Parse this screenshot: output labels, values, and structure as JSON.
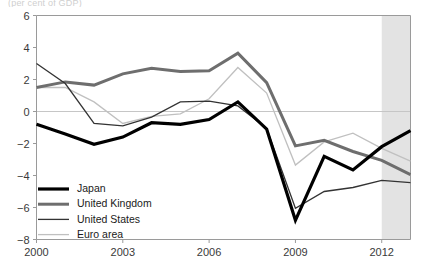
{
  "chart_data": {
    "type": "line",
    "title": "(per cent of GDP)",
    "xlabel": "",
    "ylabel": "",
    "x": [
      2000,
      2001,
      2002,
      2003,
      2004,
      2005,
      2006,
      2007,
      2008,
      2009,
      2010,
      2011,
      2012,
      2013
    ],
    "xlim": [
      2000,
      2013
    ],
    "ylim": [
      -8,
      6
    ],
    "ytick_labels": [
      "6",
      "4",
      "2",
      "0",
      "−2",
      "−4",
      "−6",
      "−8"
    ],
    "yticks": [
      6,
      4,
      2,
      0,
      -2,
      -4,
      -6,
      -8
    ],
    "xtick_labels": [
      "2000",
      "2003",
      "2006",
      "2009",
      "2012"
    ],
    "xticks": [
      2000,
      2003,
      2006,
      2009,
      2012
    ],
    "grid": false,
    "zero_line": true,
    "legend_position": "lower-left",
    "shaded_region": {
      "label": "forecast",
      "from": 2012,
      "to": 2013,
      "color": "#e3e3e3"
    },
    "series": [
      {
        "name": "Japan",
        "color": "#000000",
        "width": 3.2,
        "values": [
          -0.8,
          -1.4,
          -2.05,
          -1.6,
          -0.7,
          -0.8,
          -0.5,
          0.6,
          -1.1,
          -6.8,
          -2.8,
          -3.65,
          -2.2,
          -1.2
        ]
      },
      {
        "name": "United Kingdom",
        "color": "#6e6e6e",
        "width": 3.0,
        "values": [
          1.5,
          1.85,
          1.65,
          2.35,
          2.7,
          2.5,
          2.55,
          3.65,
          1.8,
          -2.15,
          -1.8,
          -2.5,
          -3.05,
          -3.95
        ]
      },
      {
        "name": "United States",
        "color": "#333333",
        "width": 1.3,
        "values": [
          3.0,
          1.75,
          -0.75,
          -0.9,
          -0.35,
          0.6,
          0.65,
          0.35,
          -1.05,
          -6.05,
          -5.0,
          -4.75,
          -4.3,
          -4.45
        ]
      },
      {
        "name": "Euro area",
        "color": "#c0c0c0",
        "width": 1.3,
        "values": [
          1.5,
          1.5,
          0.6,
          -0.75,
          -0.3,
          -0.15,
          0.8,
          2.75,
          1.15,
          -3.35,
          -1.9,
          -1.35,
          -2.3,
          -3.1
        ]
      }
    ]
  },
  "legend": {
    "items": [
      {
        "label": "Japan"
      },
      {
        "label": "United Kingdom"
      },
      {
        "label": "United States"
      },
      {
        "label": "Euro area"
      }
    ]
  }
}
